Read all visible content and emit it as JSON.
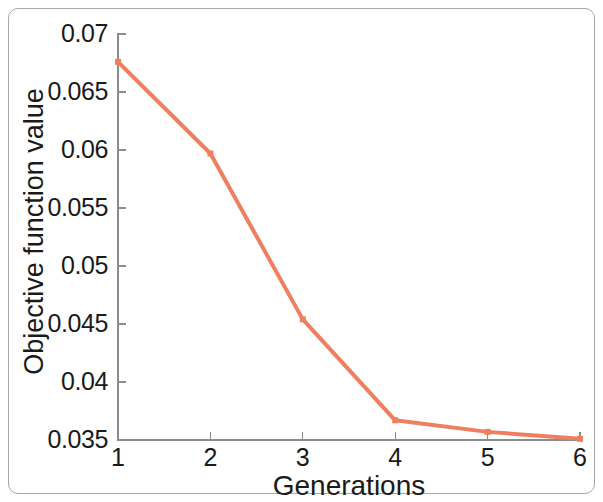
{
  "figure": {
    "frame_color": "#a8a8a8",
    "background": "#ffffff"
  },
  "chart_data": {
    "type": "line",
    "title": "",
    "subtitle": "",
    "xlabel": "Generations",
    "ylabel": "Objective function value",
    "x": [
      1,
      2,
      3,
      4,
      5,
      6
    ],
    "values": [
      0.0676,
      0.0597,
      0.0454,
      0.0367,
      0.0357,
      0.0351
    ],
    "series": [
      {
        "name": "Best objective function value",
        "color": "#ef7f5e",
        "marker": "square",
        "line_width": 4,
        "values": [
          0.0676,
          0.0597,
          0.0454,
          0.0367,
          0.0357,
          0.0351
        ]
      }
    ],
    "xlim": [
      1,
      6
    ],
    "ylim": [
      0.035,
      0.07
    ],
    "xticks": [
      1,
      2,
      3,
      4,
      5,
      6
    ],
    "yticks": [
      0.035,
      0.04,
      0.045,
      0.05,
      0.055,
      0.06,
      0.065,
      0.07
    ],
    "xtick_labels": [
      "1",
      "2",
      "3",
      "4",
      "5",
      "6"
    ],
    "ytick_labels": [
      "0.035",
      "0.04",
      "0.045",
      "0.05",
      "0.055",
      "0.06",
      "0.065",
      "0.07"
    ],
    "grid": false,
    "legend": null,
    "legend_position": "none",
    "annotations": []
  }
}
